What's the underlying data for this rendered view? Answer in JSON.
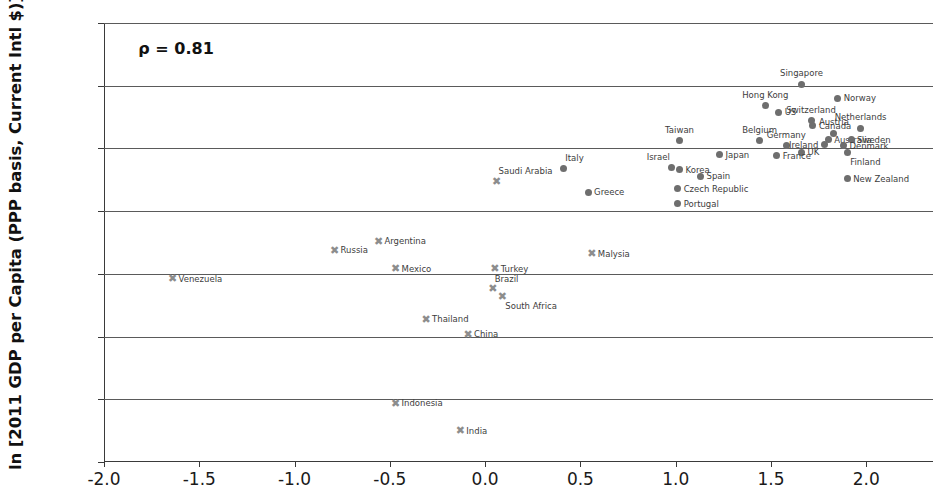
{
  "chart_data": {
    "type": "scatter",
    "title": "",
    "xlabel": "",
    "ylabel": "ln [2011 GDP per Capita (PPP basis, Current Intl $)]",
    "xlim": [
      -2.0,
      2.35
    ],
    "ylim": [
      8.0,
      11.5
    ],
    "xticks": [
      "-2.0",
      "-1.5",
      "-1.0",
      "-0.5",
      "0.0",
      "0.5",
      "1.0",
      "1.5",
      "2.0"
    ],
    "xtick_values": [
      -2.0,
      -1.5,
      -1.0,
      -0.5,
      0.0,
      0.5,
      1.0,
      1.5,
      2.0
    ],
    "yticks": [
      "8.0",
      "8.5",
      "9.0",
      "9.5",
      "10.0",
      "10.5",
      "11.0",
      "11.5"
    ],
    "ytick_values": [
      8.0,
      8.5,
      9.0,
      9.5,
      10.0,
      10.5,
      11.0,
      11.5
    ],
    "grid": "horizontal",
    "legend": "none",
    "annotations": [
      {
        "text": "ρ = 0.81",
        "x": -1.82,
        "y": 11.3
      }
    ],
    "series": [
      {
        "name": "Developed markets",
        "marker": "circle",
        "color": "#6e6e6e",
        "points": [
          {
            "label": "Singapore",
            "x": 1.66,
            "y": 11.01,
            "lpos": "t"
          },
          {
            "label": "Norway",
            "x": 1.85,
            "y": 10.9,
            "lpos": "r"
          },
          {
            "label": "Hong Kong",
            "x": 1.47,
            "y": 10.84,
            "lpos": "t"
          },
          {
            "label": "US",
            "x": 1.54,
            "y": 10.79,
            "lpos": "r"
          },
          {
            "label": "Switzerland",
            "x": 1.71,
            "y": 10.72,
            "lpos": "t"
          },
          {
            "label": "Canada",
            "x": 1.72,
            "y": 10.68,
            "lpos": "r"
          },
          {
            "label": "Netherlands",
            "x": 1.97,
            "y": 10.66,
            "lpos": "t"
          },
          {
            "label": "Austria",
            "x": 1.83,
            "y": 10.62,
            "lpos": "t"
          },
          {
            "label": "Australia",
            "x": 1.8,
            "y": 10.57,
            "lpos": "r"
          },
          {
            "label": "Sweden",
            "x": 1.92,
            "y": 10.57,
            "lpos": "r"
          },
          {
            "label": "Taiwan",
            "x": 1.02,
            "y": 10.56,
            "lpos": "t"
          },
          {
            "label": "Belgium",
            "x": 1.44,
            "y": 10.56,
            "lpos": "t"
          },
          {
            "label": "Germany",
            "x": 1.58,
            "y": 10.52,
            "lpos": "t"
          },
          {
            "label": "Ireland",
            "x": 1.78,
            "y": 10.53,
            "lpos": "l"
          },
          {
            "label": "Denmark",
            "x": 1.88,
            "y": 10.52,
            "lpos": "r"
          },
          {
            "label": "Finland",
            "x": 1.9,
            "y": 10.47,
            "lpos": "br"
          },
          {
            "label": "UK",
            "x": 1.66,
            "y": 10.47,
            "lpos": "r"
          },
          {
            "label": "France",
            "x": 1.53,
            "y": 10.44,
            "lpos": "r"
          },
          {
            "label": "Japan",
            "x": 1.23,
            "y": 10.45,
            "lpos": "r"
          },
          {
            "label": "Italy",
            "x": 0.41,
            "y": 10.34,
            "lpos": "tr"
          },
          {
            "label": "Israel",
            "x": 0.98,
            "y": 10.35,
            "lpos": "tl"
          },
          {
            "label": "Korea",
            "x": 1.02,
            "y": 10.33,
            "lpos": "r"
          },
          {
            "label": "Spain",
            "x": 1.13,
            "y": 10.28,
            "lpos": "r"
          },
          {
            "label": "New Zealand",
            "x": 1.9,
            "y": 10.26,
            "lpos": "r"
          },
          {
            "label": "Czech Republic",
            "x": 1.01,
            "y": 10.18,
            "lpos": "r"
          },
          {
            "label": "Greece",
            "x": 0.54,
            "y": 10.15,
            "lpos": "r"
          },
          {
            "label": "Portugal",
            "x": 1.01,
            "y": 10.06,
            "lpos": "r"
          }
        ]
      },
      {
        "name": "Emerging markets",
        "marker": "x",
        "color": "#8d8d8d",
        "points": [
          {
            "label": "Saudi Arabia",
            "x": 0.06,
            "y": 10.24,
            "lpos": "tr"
          },
          {
            "label": "Argentina",
            "x": -0.56,
            "y": 9.76,
            "lpos": "r"
          },
          {
            "label": "Russia",
            "x": -0.79,
            "y": 9.69,
            "lpos": "r"
          },
          {
            "label": "Malysia",
            "x": 0.56,
            "y": 9.66,
            "lpos": "r"
          },
          {
            "label": "Mexico",
            "x": -0.47,
            "y": 9.54,
            "lpos": "r"
          },
          {
            "label": "Turkey",
            "x": 0.05,
            "y": 9.54,
            "lpos": "r"
          },
          {
            "label": "Venezuela",
            "x": -1.64,
            "y": 9.46,
            "lpos": "r"
          },
          {
            "label": "Brazil",
            "x": 0.04,
            "y": 9.38,
            "lpos": "tr"
          },
          {
            "label": "South Africa",
            "x": 0.09,
            "y": 9.32,
            "lpos": "br"
          },
          {
            "label": "Thailand",
            "x": -0.31,
            "y": 9.14,
            "lpos": "r"
          },
          {
            "label": "China",
            "x": -0.09,
            "y": 9.02,
            "lpos": "r"
          },
          {
            "label": "Indonesia",
            "x": -0.47,
            "y": 8.47,
            "lpos": "r"
          },
          {
            "label": "India",
            "x": -0.13,
            "y": 8.25,
            "lpos": "r"
          }
        ]
      }
    ]
  }
}
